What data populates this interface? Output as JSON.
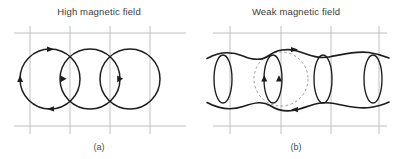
{
  "figure": {
    "background_color": "#ffffff",
    "line_color": "#1d1d1d",
    "grid_color": "#b9b9b9",
    "ghost_color": "#8d8d8d",
    "panels": [
      {
        "id": "a",
        "title": "High magnetic field",
        "caption": "(a)",
        "description": "Three large overlapping circular cyclotron orbits crossing a rectangular grid, with directional arrowheads on the leftmost orbit",
        "orbit_count": 3,
        "orbit_shape": "circle",
        "orbit_radius": 30,
        "orbit_centers_x": [
          50,
          90,
          130
        ],
        "orbit_center_y": 79,
        "grid_vertical_x": [
          30,
          70,
          110,
          150
        ],
        "grid_horizontal_y": [
          33,
          126
        ],
        "arrow_positions": [
          "top",
          "left",
          "bottom",
          "right"
        ]
      },
      {
        "id": "b",
        "title": "Weak magnetic field",
        "caption": "(b)",
        "description": "Four narrow vertical ellipses between two horizontal wavy drift lines, with a faint dashed reference circle at center",
        "orbit_count": 4,
        "orbit_shape": "ellipse",
        "ellipse_rx": 9,
        "ellipse_ry": 24,
        "ellipse_centers_x": [
          25,
          75,
          125,
          175
        ],
        "ellipse_center_y": 79,
        "grid_vertical_x": [
          31,
          83,
          133,
          181
        ],
        "grid_horizontal_y": [
          33,
          126
        ],
        "wavy_line_y": [
          54,
          104
        ],
        "ghost_circle": {
          "cx": 75,
          "cy": 79,
          "r": 27
        },
        "arrow_positions": [
          "top",
          "bottom",
          "left",
          "right"
        ]
      }
    ]
  }
}
